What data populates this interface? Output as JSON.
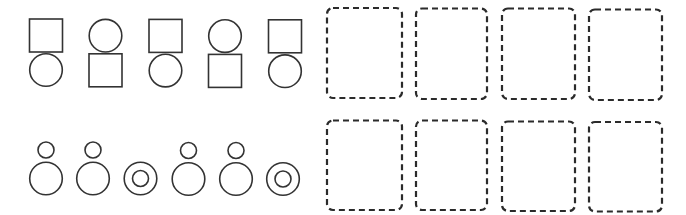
{
  "colors": {
    "stroke": "#333333",
    "dash": "#2b2b2b",
    "background": "#ffffff"
  },
  "rows": [
    {
      "name": "top-row",
      "figures": [
        {
          "top": "square",
          "bottom": "circle",
          "cx": 46
        },
        {
          "top": "circle",
          "bottom": "square",
          "cx": 105.5
        },
        {
          "top": "square",
          "bottom": "circle",
          "cx": 165.5
        },
        {
          "top": "circle",
          "bottom": "square",
          "cx": 225
        },
        {
          "top": "square",
          "bottom": "circle",
          "cx": 285
        }
      ],
      "answer_boxes": [
        {
          "x": 327,
          "y": 8,
          "w": 75,
          "h": 90
        },
        {
          "x": 416,
          "y": 8.5,
          "w": 71,
          "h": 90.5
        },
        {
          "x": 502,
          "y": 8.5,
          "w": 73,
          "h": 90.5
        },
        {
          "x": 589,
          "y": 9.5,
          "w": 73,
          "h": 90.5
        }
      ]
    },
    {
      "name": "bottom-row",
      "figures": [
        {
          "type": "small-over-large",
          "cx": 46
        },
        {
          "type": "small-over-large",
          "cx": 93
        },
        {
          "type": "concentric",
          "cx": 140.5
        },
        {
          "type": "small-over-large",
          "cx": 188.5
        },
        {
          "type": "small-over-large",
          "cx": 236
        },
        {
          "type": "concentric",
          "cx": 283
        }
      ],
      "answer_boxes": [
        {
          "x": 327,
          "y": 120.5,
          "w": 75,
          "h": 89.5
        },
        {
          "x": 416,
          "y": 120.5,
          "w": 71,
          "h": 89.5
        },
        {
          "x": 502,
          "y": 121.5,
          "w": 73,
          "h": 89.5
        },
        {
          "x": 589,
          "y": 122,
          "w": 73,
          "h": 89.5
        }
      ]
    }
  ]
}
